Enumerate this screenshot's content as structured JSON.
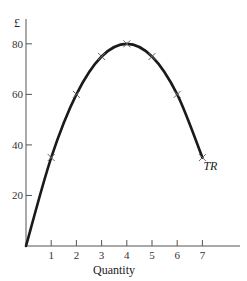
{
  "chart_data": {
    "type": "line",
    "title": "",
    "xlabel": "Quantity",
    "ylabel": "£",
    "x": [
      0,
      1,
      2,
      3,
      4,
      5,
      6,
      7
    ],
    "series": [
      {
        "name": "TR",
        "values": [
          0,
          35,
          60,
          75,
          80,
          75,
          60,
          35
        ],
        "marker": "x",
        "marked_points": [
          1,
          2,
          3,
          4,
          5,
          6,
          7
        ]
      }
    ],
    "xticks": [
      "1",
      "2",
      "3",
      "4",
      "5",
      "6",
      "7"
    ],
    "yticks": [
      "20",
      "40",
      "60",
      "80"
    ],
    "xlim": [
      0,
      8.5
    ],
    "ylim": [
      0,
      90
    ],
    "grid": false,
    "legend": "inline label at end of curve",
    "line_color": "#1a1a1a"
  }
}
